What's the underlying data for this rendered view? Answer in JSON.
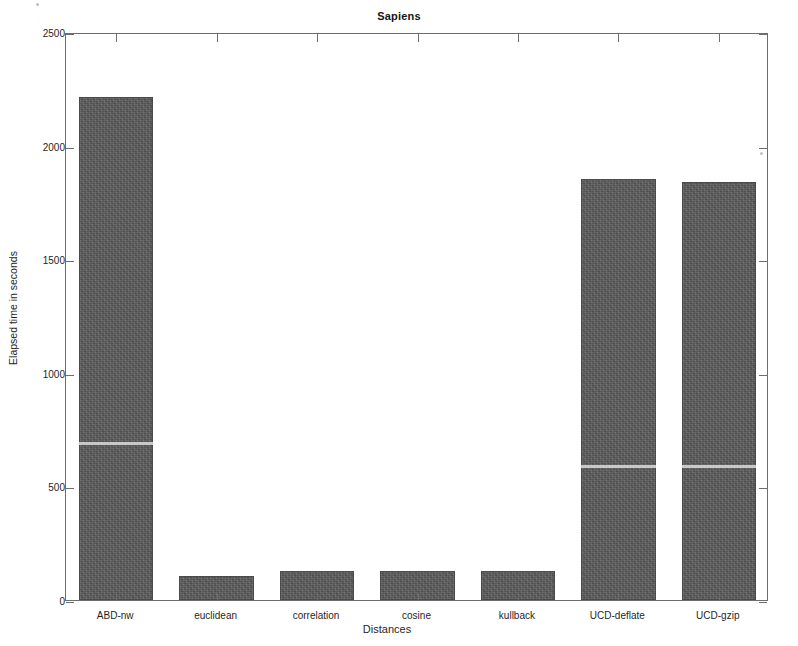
{
  "chart_data": {
    "type": "bar",
    "title": "Sapiens",
    "xlabel": "Distances",
    "ylabel": "Elapsed time in seconds",
    "categories": [
      "ABD-nw",
      "euclidean",
      "correlation",
      "cosine",
      "kullback",
      "UCD-deflate",
      "UCD-gzip"
    ],
    "values": [
      2213,
      106,
      129,
      128,
      129,
      1852,
      1838
    ],
    "ylim": [
      0,
      2500
    ],
    "yticks": [
      0,
      500,
      1000,
      1500,
      2000,
      2500
    ],
    "ytick_labels": [
      "0",
      "500",
      "1000",
      "1500",
      "2000",
      "2500"
    ],
    "grid": false,
    "legend": null,
    "bar_color": "#595959",
    "axis_color": "#6d6d6d",
    "background": "#ffffff"
  },
  "figure": {
    "title": "Sapiens",
    "x_axis_title": "Distances",
    "y_axis_title": "Elapsed time in seconds"
  }
}
